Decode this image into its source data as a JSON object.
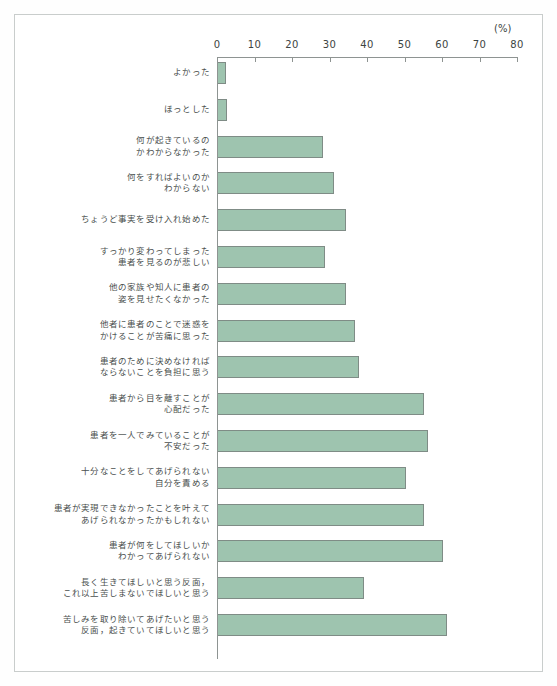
{
  "chart_data": {
    "type": "bar",
    "orientation": "horizontal",
    "title": "",
    "xlabel": "(%)",
    "ylabel": "",
    "xlim": [
      0,
      80
    ],
    "xticks": [
      0,
      10,
      20,
      30,
      40,
      50,
      60,
      70,
      80
    ],
    "grid": false,
    "legend": null,
    "unit_label": "(%)",
    "bar_color": "#9ec4af",
    "bar_border_color": "#7f8c86",
    "categories": [
      "よかった",
      "ほっとした",
      "何が起きているの\nかわからなかった",
      "何をすればよいのか\nわからない",
      "ちょうど事実を受け入れ始めた",
      "すっかり変わってしまった\n患者を見るのが悲しい",
      "他の家族や知人に患者の\n姿を見せたくなかった",
      "他者に患者のことで迷惑を\nかけることが苦痛に思った",
      "患者のために決めなければ\nならないことを負担に思う",
      "患者から目を離すことが\n心配だった",
      "患者を一人でみていることが\n不安だった",
      "十分なことをしてあげられない\n自分を責める",
      "患者が実現できなかったことを叶えて\nあげられなかったかもしれない",
      "患者が何をしてほしいか\nわかってあげられない",
      "長く生きてほしいと思う反面，\nこれ以上苦しまないでほしいと思う",
      "苦しみを取り除いてあげたいと思う\n反面，起きていてほしいと思う"
    ],
    "values": [
      2,
      2.5,
      28,
      31,
      34,
      28.5,
      34,
      36.5,
      37.5,
      55,
      56,
      50,
      55,
      60,
      39,
      61
    ]
  }
}
